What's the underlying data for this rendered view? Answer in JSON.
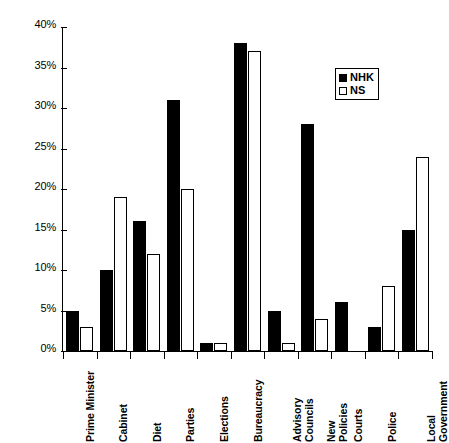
{
  "chart_data": {
    "type": "bar",
    "title": "",
    "subtitle": "",
    "xlabel": "",
    "ylabel": "",
    "ylim": [
      0,
      40
    ],
    "y_tick_labels": [
      "0%",
      "5%",
      "10%",
      "15%",
      "20%",
      "25%",
      "30%",
      "35%",
      "40%"
    ],
    "y_tick_values": [
      0,
      5,
      10,
      15,
      20,
      25,
      30,
      35,
      40
    ],
    "grid": false,
    "legend_position": "upper-right",
    "categories": [
      "Prime Minister",
      "Cabinet",
      "Diet",
      "Parties",
      "Elections",
      "Bureaucracy",
      "Advisory\nCouncils",
      "New\nPolicies",
      "Courts",
      "Police",
      "Local\nGovernment"
    ],
    "series": [
      {
        "name": "NHK",
        "color": "#000000",
        "fill": "solid",
        "values": [
          5,
          10,
          16,
          31,
          1,
          38,
          5,
          28,
          6,
          3,
          15
        ]
      },
      {
        "name": "NS",
        "color": "#ffffff",
        "fill": "hollow",
        "values": [
          3,
          19,
          12,
          20,
          1,
          37,
          1,
          4,
          0,
          8,
          24
        ]
      }
    ]
  },
  "legend": {
    "items": [
      {
        "label": "NHK",
        "swatch": "filled-square"
      },
      {
        "label": "NS",
        "swatch": "hollow-square"
      }
    ]
  }
}
